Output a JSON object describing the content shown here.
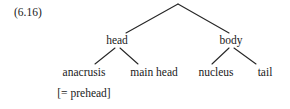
{
  "figure": {
    "number": "(6.16)",
    "kind": "linguistic tree diagram",
    "ink_color": "#262626",
    "background_color": "#ffffff"
  },
  "tree": {
    "root": {
      "label": "",
      "x": 178,
      "y": 4
    },
    "nodes": [
      {
        "id": "head",
        "label": "head",
        "x": 117,
        "y": 40
      },
      {
        "id": "body",
        "label": "body",
        "x": 231,
        "y": 40
      },
      {
        "id": "anacrusis",
        "label": "anacrusis",
        "x": 84,
        "y": 72
      },
      {
        "id": "main-head",
        "label": "main head",
        "x": 154,
        "y": 72
      },
      {
        "id": "nucleus",
        "label": "nucleus",
        "x": 216,
        "y": 72
      },
      {
        "id": "tail",
        "label": "tail",
        "x": 265,
        "y": 72
      }
    ],
    "gloss": {
      "id": "prehead-gloss",
      "label": "[= prehead]",
      "x": 84,
      "y": 93,
      "refers_to": "anacrusis"
    },
    "edges": [
      {
        "from": "root",
        "to": "head",
        "x1": 178,
        "y1": 4,
        "x2": 126,
        "y2": 33
      },
      {
        "from": "root",
        "to": "body",
        "x1": 178,
        "y1": 4,
        "x2": 229,
        "y2": 33
      },
      {
        "from": "head",
        "to": "anacrusis",
        "x1": 115,
        "y1": 48,
        "x2": 95,
        "y2": 64
      },
      {
        "from": "head",
        "to": "main-head",
        "x1": 120,
        "y1": 48,
        "x2": 138,
        "y2": 64
      },
      {
        "from": "body",
        "to": "nucleus",
        "x1": 229,
        "y1": 48,
        "x2": 212,
        "y2": 64
      },
      {
        "from": "body",
        "to": "tail",
        "x1": 234,
        "y1": 48,
        "x2": 256,
        "y2": 64
      }
    ]
  }
}
